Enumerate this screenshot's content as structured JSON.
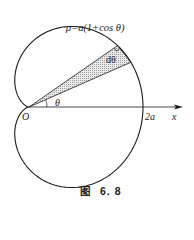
{
  "diagram": {
    "curve_equation": "ρ=a(1+cos θ)",
    "wedge_angle_label": "dθ",
    "angle_label": "θ",
    "origin_label": "O",
    "intercept_label": "2a",
    "axis_label": "x",
    "caption_prefix": "图",
    "caption_number": "6. 8",
    "curve_type": "cardioid",
    "wedge_start_deg": 22,
    "wedge_end_deg": 32.5,
    "colors": {
      "stroke": "#1a1a1a",
      "wedge_fill": "#d8d8d8",
      "background": "#ffffff"
    }
  }
}
